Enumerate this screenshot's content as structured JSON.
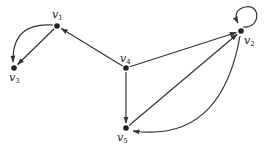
{
  "diagram": {
    "type": "directed-graph",
    "nodes": [
      {
        "id": "v1",
        "label": "v",
        "sub": "1",
        "x": 57,
        "y": 26,
        "lx": 52,
        "ly": 18
      },
      {
        "id": "v2",
        "label": "v",
        "sub": "2",
        "x": 241,
        "y": 31,
        "lx": 244,
        "ly": 44
      },
      {
        "id": "v3",
        "label": "v",
        "sub": "3",
        "x": 14,
        "y": 68,
        "lx": 9,
        "ly": 81
      },
      {
        "id": "v4",
        "label": "v",
        "sub": "4",
        "x": 126,
        "y": 68,
        "lx": 120,
        "ly": 62
      },
      {
        "id": "v5",
        "label": "v",
        "sub": "5",
        "x": 126,
        "y": 128,
        "lx": 117,
        "ly": 141
      }
    ],
    "edges": [
      {
        "from": "v1",
        "to": "v3",
        "kind": "straight"
      },
      {
        "from": "v1",
        "to": "v3",
        "kind": "curved"
      },
      {
        "from": "v4",
        "to": "v1",
        "kind": "straight"
      },
      {
        "from": "v4",
        "to": "v2",
        "kind": "straight"
      },
      {
        "from": "v4",
        "to": "v5",
        "kind": "straight"
      },
      {
        "from": "v5",
        "to": "v2",
        "kind": "straight"
      },
      {
        "from": "v2",
        "to": "v5",
        "kind": "curved"
      },
      {
        "from": "v2",
        "to": "v2",
        "kind": "loop"
      }
    ],
    "colors": {
      "stroke": "#333333",
      "node": "#222222"
    }
  }
}
